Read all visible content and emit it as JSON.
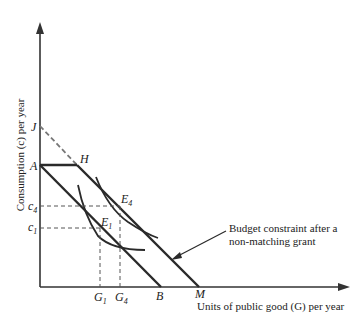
{
  "diagram": {
    "y_axis_label": "Consumption (c) per year",
    "x_axis_label": "Units of public good (G) per year",
    "points": {
      "J": "J",
      "A": "A",
      "H": "H",
      "E4": "E",
      "E4_sub": "4",
      "E1": "E",
      "E1_sub": "1",
      "B": "B",
      "M": "M"
    },
    "y_ticks": {
      "c4": "c",
      "c4_sub": "4",
      "c1": "c",
      "c1_sub": "1"
    },
    "x_ticks": {
      "G1": "G",
      "G1_sub": "1",
      "G4": "G",
      "G4_sub": "4"
    },
    "annotation": {
      "line1": "Budget constraint after a",
      "line2": "non-matching grant"
    },
    "colors": {
      "line": "#2a2a2a",
      "dashed": "#6a6a6a"
    }
  }
}
